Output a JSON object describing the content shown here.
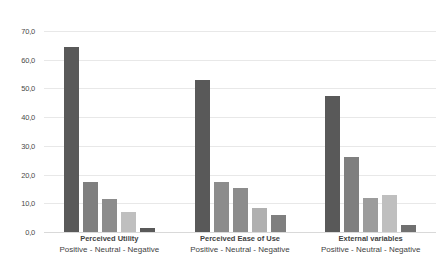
{
  "chart_data": {
    "type": "bar",
    "title": "",
    "xlabel": "",
    "ylabel": "",
    "ylim": [
      0,
      70
    ],
    "ytick_step": 10,
    "ytick_labels": [
      "70,0",
      "60,0",
      "50,0",
      "40,0",
      "30,0",
      "20,0",
      "10,0",
      "0,0"
    ],
    "ytick_values": [
      70,
      60,
      50,
      40,
      30,
      20,
      10,
      0
    ],
    "grid": true,
    "legend": "none",
    "decimal_separator": ",",
    "categories": [
      "Perceived Utility",
      "Perceived Ease of Use",
      "External variables"
    ],
    "category_sublabel": "Positive - Neutral - Negative",
    "bars_per_category": 5,
    "groups": [
      {
        "name": "Perceived Utility",
        "sublabel": "Positive - Neutral - Negative",
        "values": [
          64.5,
          17.5,
          11.5,
          7.0,
          1.5
        ],
        "colors": [
          "#595959",
          "#7f7f7f",
          "#8c8c8c",
          "#bfbfbf",
          "#595959"
        ]
      },
      {
        "name": "Perceived Ease of Use",
        "sublabel": "Positive - Neutral - Negative",
        "values": [
          53.0,
          17.5,
          15.5,
          8.5,
          6.0
        ],
        "colors": [
          "#595959",
          "#8c8c8c",
          "#8c8c8c",
          "#b0b0b0",
          "#7f7f7f"
        ]
      },
      {
        "name": "External variables",
        "sublabel": "Positive - Neutral - Negative",
        "values": [
          47.5,
          26.0,
          12.0,
          13.0,
          2.5
        ],
        "colors": [
          "#595959",
          "#7f7f7f",
          "#9c9c9c",
          "#bfbfbf",
          "#707070"
        ]
      }
    ],
    "colors": {
      "bar_dark": "#595959",
      "bar_mid": "#808080",
      "bar_light": "#bfbfbf",
      "gridline": "#e8e8e8",
      "text": "#3f3f3f",
      "background": "#ffffff"
    }
  },
  "caption": {
    "text": ""
  }
}
